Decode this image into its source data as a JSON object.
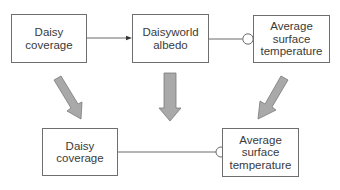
{
  "diagram": {
    "top_row": {
      "daisy_coverage": {
        "line1": "Daisy",
        "line2": "coverage"
      },
      "daisyworld_albedo": {
        "line1": "Daisyworld",
        "line2": "albedo"
      },
      "avg_surface_temp": {
        "line1": "Average",
        "line2": "surface",
        "line3": "temperature"
      }
    },
    "bottom_row": {
      "daisy_coverage": {
        "line1": "Daisy",
        "line2": "coverage"
      },
      "avg_surface_temp": {
        "line1": "Average",
        "line2": "surface",
        "line3": "temperature"
      }
    },
    "links": [
      {
        "from": "Daisy coverage",
        "to": "Daisyworld albedo",
        "type": "positive-arrow"
      },
      {
        "from": "Daisyworld albedo",
        "to": "Average surface temperature",
        "type": "negative-circle"
      },
      {
        "from": "Daisy coverage (bottom)",
        "to": "Average surface temperature (bottom)",
        "type": "negative-circle"
      }
    ],
    "colors": {
      "box_border": "#6e6e6e",
      "text": "#3a3a3a",
      "connector": "#5a5a5a",
      "block_arrow_fill": "#a9a9a9",
      "block_arrow_stroke": "#7a7a7a"
    }
  }
}
